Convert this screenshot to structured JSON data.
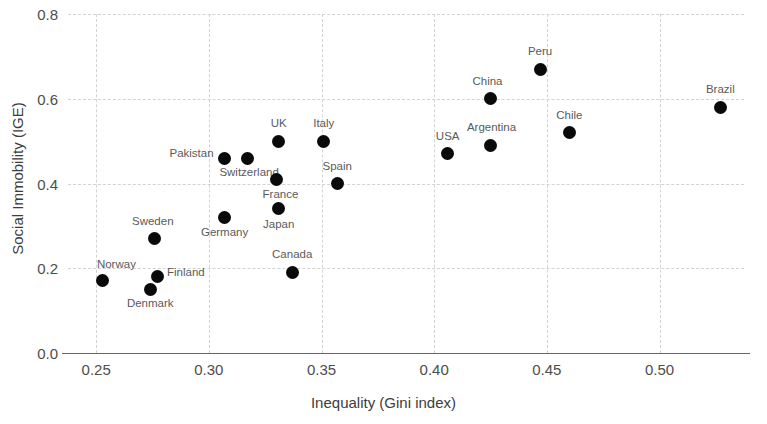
{
  "chart_data": {
    "type": "scatter",
    "title": "",
    "xlabel": "Inequality (Gini index)",
    "ylabel": "Social Immobility (IGE)",
    "xlim": [
      0.2375,
      0.5375
    ],
    "ylim": [
      0.0,
      0.8
    ],
    "xticks": [
      "0.25",
      "0.30",
      "0.35",
      "0.40",
      "0.45",
      "0.50"
    ],
    "xtick_values": [
      0.25,
      0.3,
      0.35,
      0.4,
      0.45,
      0.5
    ],
    "yticks": [
      "0.0",
      "0.2",
      "0.4",
      "0.6",
      "0.8"
    ],
    "ytick_values": [
      0.0,
      0.2,
      0.4,
      0.6,
      0.8
    ],
    "grid": true,
    "grid_style": "dashed",
    "legend": "none",
    "marker": "circle",
    "marker_color": "#0a0a0a",
    "points": [
      {
        "label": "Norway",
        "x": 0.253,
        "y": 0.17,
        "label_dx": -6,
        "label_dy": -17,
        "label_align": "left"
      },
      {
        "label": "Denmark",
        "x": 0.274,
        "y": 0.15,
        "label_dx": 0,
        "label_dy": 14,
        "label_align": "center"
      },
      {
        "label": "Sweden",
        "x": 0.276,
        "y": 0.27,
        "label_dx": -2,
        "label_dy": -18,
        "label_align": "center"
      },
      {
        "label": "Finland",
        "x": 0.277,
        "y": 0.18,
        "label_dx": 10,
        "label_dy": -5,
        "label_align": "left"
      },
      {
        "label": "Germany",
        "x": 0.307,
        "y": 0.32,
        "label_dx": 0,
        "label_dy": 15,
        "label_align": "center"
      },
      {
        "label": "Pakistan",
        "x": 0.307,
        "y": 0.46,
        "label_dx": -11,
        "label_dy": -5,
        "label_align": "right"
      },
      {
        "label": "Switzerland",
        "x": 0.317,
        "y": 0.46,
        "label_dx": 2,
        "label_dy": 14,
        "label_align": "center"
      },
      {
        "label": "UK",
        "x": 0.331,
        "y": 0.5,
        "label_dx": 0,
        "label_dy": -18,
        "label_align": "center"
      },
      {
        "label": "Japan",
        "x": 0.331,
        "y": 0.34,
        "label_dx": 0,
        "label_dy": 15,
        "label_align": "center"
      },
      {
        "label": "France",
        "x": 0.33,
        "y": 0.41,
        "label_dx": 4,
        "label_dy": 15,
        "label_align": "center"
      },
      {
        "label": "Canada",
        "x": 0.337,
        "y": 0.19,
        "label_dx": 0,
        "label_dy": -18,
        "label_align": "center"
      },
      {
        "label": "Italy",
        "x": 0.351,
        "y": 0.5,
        "label_dx": 0,
        "label_dy": -18,
        "label_align": "center"
      },
      {
        "label": "Spain",
        "x": 0.357,
        "y": 0.4,
        "label_dx": 0,
        "label_dy": -18,
        "label_align": "center"
      },
      {
        "label": "USA",
        "x": 0.406,
        "y": 0.47,
        "label_dx": 0,
        "label_dy": -18,
        "label_align": "center"
      },
      {
        "label": "China",
        "x": 0.425,
        "y": 0.6,
        "label_dx": -3,
        "label_dy": -18,
        "label_align": "center"
      },
      {
        "label": "Argentina",
        "x": 0.425,
        "y": 0.49,
        "label_dx": 1,
        "label_dy": -18,
        "label_align": "center"
      },
      {
        "label": "Peru",
        "x": 0.447,
        "y": 0.67,
        "label_dx": 0,
        "label_dy": -18,
        "label_align": "center"
      },
      {
        "label": "Chile",
        "x": 0.46,
        "y": 0.52,
        "label_dx": 0,
        "label_dy": -18,
        "label_align": "center"
      },
      {
        "label": "Brazil",
        "x": 0.527,
        "y": 0.58,
        "label_dx": 0,
        "label_dy": -18,
        "label_align": "center"
      }
    ]
  }
}
